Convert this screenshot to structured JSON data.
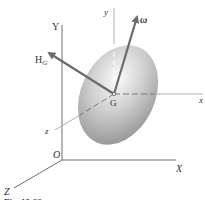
{
  "figure": {
    "colors": {
      "axis": "#6f6f6f",
      "body_axis": "#8a8a8a",
      "arrow": "#6b6b6b",
      "ellipsoid_light": "#f2f2f2",
      "ellipsoid_dark": "#8c8c8c",
      "text": "#333333"
    },
    "inertial_axes": {
      "origin_label": "O",
      "x_label": "X",
      "y_label": "Y",
      "z_label": "Z"
    },
    "body_axes": {
      "center_label": "G",
      "x_label": "x",
      "y_label": "y",
      "z_label": "z"
    },
    "vectors": {
      "angular_velocity_label": "ω",
      "angular_momentum_label": "H",
      "angular_momentum_subscript": "G"
    },
    "caption": "Fig. 19-??"
  }
}
